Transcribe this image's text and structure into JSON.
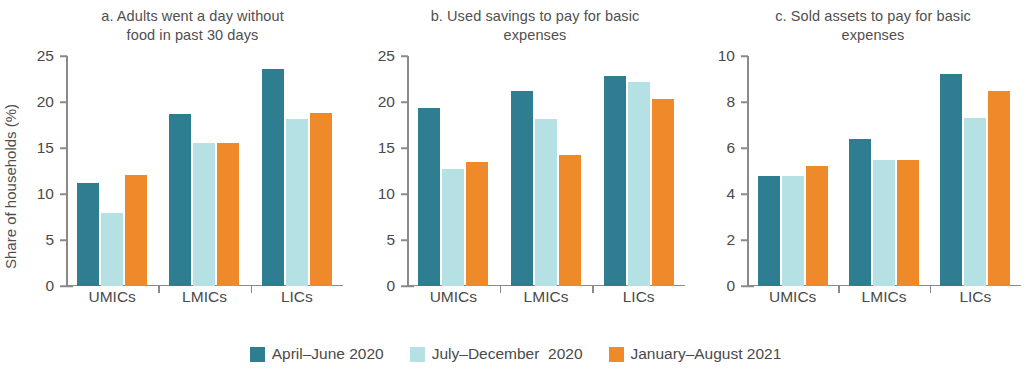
{
  "ylabel": "Share of households (%)",
  "colors": {
    "series0": "#2e7d91",
    "series1": "#b6e1e4",
    "series2": "#ef8a2b"
  },
  "legend": {
    "items": [
      {
        "label": "April–June 2020",
        "color": "#2e7d91"
      },
      {
        "label": "July–December  2020",
        "color": "#b6e1e4"
      },
      {
        "label": "January–August 2021",
        "color": "#ef8a2b"
      }
    ]
  },
  "panels": [
    {
      "id": "a",
      "title": "a. Adults went a day without\nfood in past 30 days"
    },
    {
      "id": "b",
      "title": "b. Used savings to pay for basic\nexpenses"
    },
    {
      "id": "c",
      "title": "c. Sold assets to pay for basic\nexpenses"
    }
  ],
  "chart_data": [
    {
      "type": "bar",
      "title": "a. Adults went a day without food in past 30 days",
      "xlabel": "",
      "ylabel": "Share of households (%)",
      "ylim": [
        0,
        25
      ],
      "yticks": [
        0,
        5,
        10,
        15,
        20,
        25
      ],
      "grid": false,
      "legend_position": "bottom",
      "categories": [
        "UMICs",
        "LMICs",
        "LICs"
      ],
      "series": [
        {
          "name": "April–June 2020",
          "color": "#2e7d91",
          "values": [
            11.2,
            18.7,
            23.6
          ]
        },
        {
          "name": "July–December  2020",
          "color": "#b6e1e4",
          "values": [
            7.9,
            15.5,
            18.1
          ]
        },
        {
          "name": "January–August 2021",
          "color": "#ef8a2b",
          "values": [
            12.1,
            15.5,
            18.8
          ]
        }
      ]
    },
    {
      "type": "bar",
      "title": "b. Used savings to pay for basic expenses",
      "xlabel": "",
      "ylabel": "",
      "ylim": [
        0,
        25
      ],
      "yticks": [
        0,
        5,
        10,
        15,
        20,
        25
      ],
      "grid": false,
      "legend_position": "bottom",
      "categories": [
        "UMICs",
        "LMICs",
        "LICs"
      ],
      "series": [
        {
          "name": "April–June 2020",
          "color": "#2e7d91",
          "values": [
            19.4,
            21.2,
            22.8
          ]
        },
        {
          "name": "July–December  2020",
          "color": "#b6e1e4",
          "values": [
            12.7,
            18.2,
            22.2
          ]
        },
        {
          "name": "January–August 2021",
          "color": "#ef8a2b",
          "values": [
            13.5,
            14.2,
            20.3
          ]
        }
      ]
    },
    {
      "type": "bar",
      "title": "c. Sold assets to pay for basic expenses",
      "xlabel": "",
      "ylabel": "",
      "ylim": [
        0,
        10
      ],
      "yticks": [
        0,
        2,
        4,
        6,
        8,
        10
      ],
      "grid": false,
      "legend_position": "bottom",
      "categories": [
        "UMICs",
        "LMICs",
        "LICs"
      ],
      "series": [
        {
          "name": "April–June 2020",
          "color": "#2e7d91",
          "values": [
            4.8,
            6.4,
            9.2
          ]
        },
        {
          "name": "July–December  2020",
          "color": "#b6e1e4",
          "values": [
            4.8,
            5.5,
            7.3
          ]
        },
        {
          "name": "January–August 2021",
          "color": "#ef8a2b",
          "values": [
            5.2,
            5.5,
            8.5
          ]
        }
      ]
    }
  ]
}
